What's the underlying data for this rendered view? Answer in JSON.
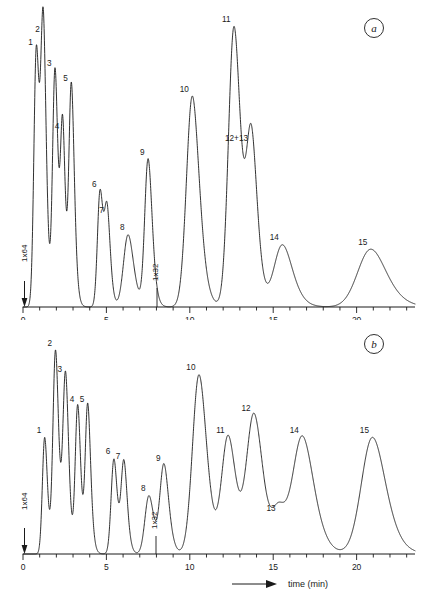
{
  "figure": {
    "panels": [
      {
        "id": "a",
        "letter": "a"
      },
      {
        "id": "b",
        "letter": "b"
      }
    ],
    "axis_title": "time (min)",
    "axis_unit": "min",
    "ink_color": "#1a1a1a",
    "background_color": "#ffffff"
  },
  "chart_data": [
    {
      "type": "line",
      "id": "panel-a",
      "title": "a",
      "xlabel": "time (min)",
      "ylabel": "",
      "xlim": [
        0,
        23.5
      ],
      "ylim": [
        0,
        100
      ],
      "grid": false,
      "legend": false,
      "tick_labels": [
        "0",
        "5",
        "10",
        "15",
        "20"
      ],
      "tick_values": [
        0,
        5,
        10,
        15,
        20
      ],
      "minor_tick_step": 1,
      "annotations": [
        {
          "text": "1x64",
          "x": 0.35,
          "orientation": "vertical",
          "note": "attenuation at start"
        },
        {
          "text": "1x32",
          "x": 8.75,
          "orientation": "vertical",
          "note": "attenuation change"
        }
      ],
      "peaks": [
        {
          "label": "1",
          "x": 0.8,
          "height": 89.0,
          "width": 0.16
        },
        {
          "label": "2",
          "x": 1.22,
          "height": 93.5,
          "width": 0.16
        },
        {
          "label": "3",
          "x": 1.92,
          "height": 82.0,
          "width": 0.16
        },
        {
          "label": "4",
          "x": 2.38,
          "height": 60.0,
          "width": 0.14
        },
        {
          "label": "5",
          "x": 2.9,
          "height": 76.5,
          "width": 0.16
        },
        {
          "label": "6",
          "x": 4.62,
          "height": 40.0,
          "width": 0.17
        },
        {
          "label": "7",
          "x": 5.05,
          "height": 31.0,
          "width": 0.17
        },
        {
          "label": "8",
          "x": 6.3,
          "height": 25.0,
          "width": 0.3
        },
        {
          "label": "9",
          "x": 7.5,
          "height": 51.0,
          "width": 0.22
        },
        {
          "label": "10",
          "x": 10.15,
          "height": 73.0,
          "width": 0.38
        },
        {
          "label": "11",
          "x": 12.65,
          "height": 97.0,
          "width": 0.36
        },
        {
          "label": "12+13",
          "x": 13.7,
          "height": 56.0,
          "width": 0.32
        },
        {
          "label": "14",
          "x": 15.55,
          "height": 21.5,
          "width": 0.55
        },
        {
          "label": "15",
          "x": 20.85,
          "height": 20.0,
          "width": 0.85
        }
      ]
    },
    {
      "type": "line",
      "id": "panel-b",
      "title": "b",
      "xlabel": "time (min)",
      "ylabel": "",
      "xlim": [
        0,
        23.5
      ],
      "ylim": [
        0,
        100
      ],
      "grid": false,
      "legend": false,
      "tick_labels": [
        "0",
        "5",
        "10",
        "15",
        "20"
      ],
      "tick_values": [
        0,
        5,
        10,
        15,
        20
      ],
      "minor_tick_step": 1,
      "annotations": [
        {
          "text": "1x64",
          "x": 0.35,
          "orientation": "vertical",
          "note": "attenuation at start"
        },
        {
          "text": "1x32",
          "x": 8.65,
          "orientation": "vertical",
          "note": "attenuation change"
        }
      ],
      "peaks": [
        {
          "label": "1",
          "x": 1.3,
          "height": 54.0,
          "width": 0.15
        },
        {
          "label": "2",
          "x": 1.95,
          "height": 94.0,
          "width": 0.17
        },
        {
          "label": "3",
          "x": 2.55,
          "height": 82.0,
          "width": 0.17
        },
        {
          "label": "4",
          "x": 3.28,
          "height": 68.5,
          "width": 0.16
        },
        {
          "label": "5",
          "x": 3.88,
          "height": 68.5,
          "width": 0.16
        },
        {
          "label": "6",
          "x": 5.45,
          "height": 44.0,
          "width": 0.18
        },
        {
          "label": "7",
          "x": 6.05,
          "height": 42.0,
          "width": 0.18
        },
        {
          "label": "8",
          "x": 7.55,
          "height": 27.0,
          "width": 0.26
        },
        {
          "label": "9",
          "x": 8.45,
          "height": 41.0,
          "width": 0.26
        },
        {
          "label": "10",
          "x": 10.55,
          "height": 83.0,
          "width": 0.42
        },
        {
          "label": "11",
          "x": 12.3,
          "height": 54.0,
          "width": 0.42
        },
        {
          "label": "12",
          "x": 13.85,
          "height": 64.0,
          "width": 0.48
        },
        {
          "label": "13",
          "x": 15.35,
          "height": 18.0,
          "width": 0.42
        },
        {
          "label": "14",
          "x": 16.75,
          "height": 54.0,
          "width": 0.62
        },
        {
          "label": "15",
          "x": 20.95,
          "height": 54.0,
          "width": 0.72
        }
      ]
    }
  ]
}
